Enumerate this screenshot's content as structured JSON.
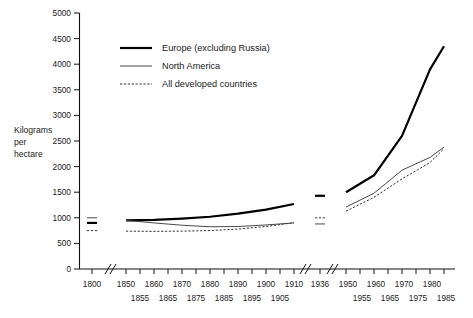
{
  "chart_data": {
    "type": "line",
    "title": "",
    "xlabel": "",
    "ylabel": "Kilograms per hectare",
    "ylabel_lines": [
      "Kilograms",
      "per",
      "hectare"
    ],
    "ylim": [
      0,
      5000
    ],
    "ytick_values": [
      0,
      500,
      1000,
      1500,
      2000,
      2500,
      3000,
      3500,
      4000,
      4500,
      5000
    ],
    "ytick_labels": [
      "0",
      "500",
      "1000",
      "1500",
      "2000",
      "2500",
      "3000",
      "3500",
      "4000",
      "4500",
      "5000"
    ],
    "grid": false,
    "legend_position": "top-left-inside",
    "axis_breaks": [
      "between 1800 and 1850",
      "between 1910 and 1936",
      "between 1936 and 1950"
    ],
    "xtick_labels_upper": [
      "1800",
      "1850",
      "1860",
      "1870",
      "1880",
      "1890",
      "1900",
      "1910",
      "1936",
      "1950",
      "1960",
      "1970",
      "1980"
    ],
    "xtick_labels_lower": [
      "1855",
      "1865",
      "1875",
      "1885",
      "1895",
      "1905",
      "1955",
      "1965",
      "1975",
      "1985"
    ],
    "series": [
      {
        "name": "Europe (excluding Russia)",
        "style": "thick-solid",
        "color": "#000000",
        "isolated_points": [
          {
            "x": "1800",
            "y": 900
          },
          {
            "x": "1936",
            "y": 1430
          }
        ],
        "segments": [
          {
            "x": [
              "1850",
              "1860",
              "1870",
              "1880",
              "1890",
              "1900",
              "1910"
            ],
            "values": [
              950,
              960,
              985,
              1020,
              1080,
              1160,
              1270
            ]
          },
          {
            "x": [
              "1950",
              "1960",
              "1970",
              "1980",
              "1985"
            ],
            "values": [
              1500,
              1830,
              2600,
              3900,
              4350
            ]
          }
        ]
      },
      {
        "name": "North America",
        "style": "thin-solid",
        "color": "#333333",
        "isolated_points": [
          {
            "x": "1800",
            "y": 1000
          },
          {
            "x": "1936",
            "y": 880
          }
        ],
        "segments": [
          {
            "x": [
              "1850",
              "1860",
              "1870",
              "1880",
              "1890",
              "1900",
              "1910"
            ],
            "values": [
              950,
              900,
              855,
              825,
              830,
              860,
              900
            ]
          },
          {
            "x": [
              "1950",
              "1960",
              "1970",
              "1980",
              "1985"
            ],
            "values": [
              1210,
              1480,
              1930,
              2180,
              2380
            ]
          }
        ]
      },
      {
        "name": "All developed countries",
        "style": "dotted",
        "color": "#333333",
        "isolated_points": [
          {
            "x": "1800",
            "y": 750
          },
          {
            "x": "1936",
            "y": 1000
          }
        ],
        "segments": [
          {
            "x": [
              "1850",
              "1860",
              "1870",
              "1880",
              "1890",
              "1900",
              "1910"
            ],
            "values": [
              740,
              735,
              740,
              750,
              780,
              830,
              905
            ]
          },
          {
            "x": [
              "1950",
              "1960",
              "1970",
              "1980",
              "1985"
            ],
            "values": [
              1130,
              1400,
              1760,
              2080,
              2350
            ]
          }
        ]
      }
    ]
  },
  "legend": {
    "items": [
      {
        "label": "Europe (excluding Russia)",
        "style": "thick-solid"
      },
      {
        "label": "North America",
        "style": "thin-solid"
      },
      {
        "label": "All developed countries",
        "style": "dotted"
      }
    ]
  }
}
